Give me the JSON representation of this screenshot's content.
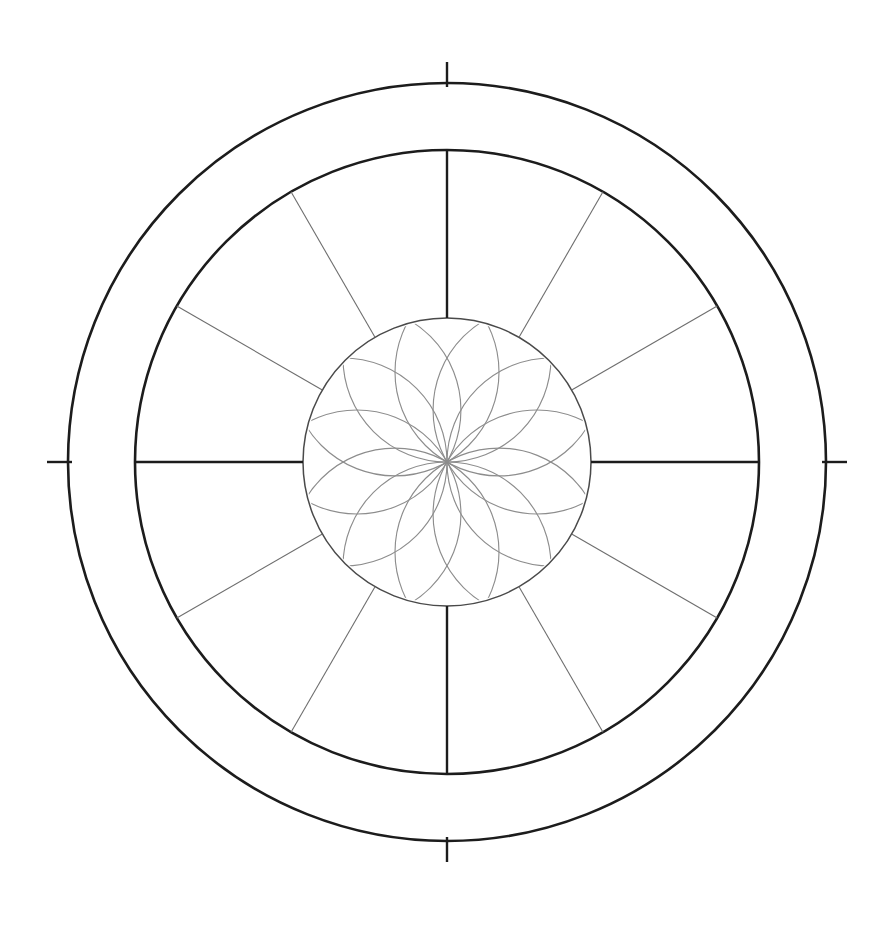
{
  "chart": {
    "center_x": 447,
    "center_y": 462,
    "radius_outer": 379,
    "radius_middle": 312,
    "radius_inner": 144,
    "radius_tick_out": 400,
    "colors": {
      "ring_stroke": "#1c1c1c",
      "inner_ring_stroke": "#4a4a4a",
      "cusp_major": "#1c1c1c",
      "cusp_minor": "#6e6e6e",
      "rosette": "#8d8d8d",
      "text": "#1e1e1e",
      "background": "#ffffff"
    }
  },
  "signs": [
    {
      "name": "aries",
      "label": "Aries",
      "glyph": "♈",
      "degree_before": "00",
      "degree_after": "00",
      "screen_angle_deg": 180,
      "stack": "vertical"
    },
    {
      "name": "pisces",
      "label": "Pisces",
      "glyph": "♓",
      "degree_before": "00",
      "degree_after": "00",
      "screen_angle_deg": 210,
      "stack": "diagonal"
    },
    {
      "name": "aquarius",
      "label": "Aquarius",
      "glyph": "♒",
      "degree_before": "00",
      "degree_after": "00",
      "screen_angle_deg": 240,
      "stack": "horizontal"
    },
    {
      "name": "capricorn",
      "label": "Capricorn",
      "glyph": "♑",
      "degree_before": "00",
      "degree_after": "00",
      "screen_angle_deg": 270,
      "stack": "horizontal"
    },
    {
      "name": "sagittarius",
      "label": "Sagittarius",
      "glyph": "♐",
      "degree_before": "00",
      "degree_after": "00",
      "screen_angle_deg": 300,
      "stack": "horizontal"
    },
    {
      "name": "scorpio",
      "label": "Scorpio",
      "glyph": "♏",
      "degree_before": "00",
      "degree_after": "00",
      "screen_angle_deg": 330,
      "stack": "diagonal"
    },
    {
      "name": "libra",
      "label": "Libra",
      "glyph": "♎",
      "degree_before": "00",
      "degree_after": "00",
      "screen_angle_deg": 0,
      "stack": "vertical"
    },
    {
      "name": "virgo",
      "label": "Virgo",
      "glyph": "♍",
      "degree_before": "00",
      "degree_after": "00",
      "screen_angle_deg": 30,
      "stack": "diagonal"
    },
    {
      "name": "leo",
      "label": "Leo",
      "glyph": "♌",
      "degree_before": "00",
      "degree_after": "00",
      "screen_angle_deg": 60,
      "stack": "horizontal"
    },
    {
      "name": "cancer",
      "label": "Cancer",
      "glyph": "♋",
      "degree_before": "00",
      "degree_after": "00",
      "screen_angle_deg": 90,
      "stack": "horizontal"
    },
    {
      "name": "gemini",
      "label": "Gemini",
      "glyph": "♊",
      "degree_before": "00",
      "degree_after": "00",
      "screen_angle_deg": 120,
      "stack": "horizontal"
    },
    {
      "name": "taurus",
      "label": "Taurus",
      "glyph": "♉",
      "degree_before": "00",
      "degree_after": "00",
      "screen_angle_deg": 150,
      "stack": "diagonal"
    }
  ],
  "houses": [
    {
      "number": "1",
      "screen_angle_deg": 192
    },
    {
      "number": "2",
      "screen_angle_deg": 222
    },
    {
      "number": "3",
      "screen_angle_deg": 253
    },
    {
      "number": "4",
      "screen_angle_deg": 287
    },
    {
      "number": "5",
      "screen_angle_deg": 318
    },
    {
      "number": "6",
      "screen_angle_deg": 348
    },
    {
      "number": "7",
      "screen_angle_deg": 12
    },
    {
      "number": "8",
      "screen_angle_deg": 42
    },
    {
      "number": "9",
      "screen_angle_deg": 73
    },
    {
      "number": "10",
      "screen_angle_deg": 107
    },
    {
      "number": "11",
      "screen_angle_deg": 138
    },
    {
      "number": "12",
      "screen_angle_deg": 168
    }
  ],
  "cusps": [
    {
      "name": "cusp-1-ascendant",
      "screen_angle_deg": 180,
      "major": true
    },
    {
      "name": "cusp-2",
      "screen_angle_deg": 210,
      "major": false
    },
    {
      "name": "cusp-3",
      "screen_angle_deg": 240,
      "major": false
    },
    {
      "name": "cusp-4-ic",
      "screen_angle_deg": 270,
      "major": true
    },
    {
      "name": "cusp-5",
      "screen_angle_deg": 300,
      "major": false
    },
    {
      "name": "cusp-6",
      "screen_angle_deg": 330,
      "major": false
    },
    {
      "name": "cusp-7-descendant",
      "screen_angle_deg": 0,
      "major": true
    },
    {
      "name": "cusp-8",
      "screen_angle_deg": 30,
      "major": false
    },
    {
      "name": "cusp-9",
      "screen_angle_deg": 60,
      "major": false
    },
    {
      "name": "cusp-10-mc",
      "screen_angle_deg": 90,
      "major": true
    },
    {
      "name": "cusp-11",
      "screen_angle_deg": 120,
      "major": false
    },
    {
      "name": "cusp-12",
      "screen_angle_deg": 150,
      "major": false
    }
  ],
  "cardinal_ticks": [
    {
      "name": "tick-mc",
      "screen_angle_deg": 270
    },
    {
      "name": "tick-ascendant",
      "screen_angle_deg": 180
    },
    {
      "name": "tick-descendant",
      "screen_angle_deg": 0
    },
    {
      "name": "tick-ic",
      "screen_angle_deg": 90
    }
  ],
  "rosette": {
    "name": "twelve-point-star-rosette",
    "points": 12,
    "arc_count": 12,
    "arc_radius": 104,
    "ring_radius": 104,
    "stroke": "#8d8d8d"
  }
}
